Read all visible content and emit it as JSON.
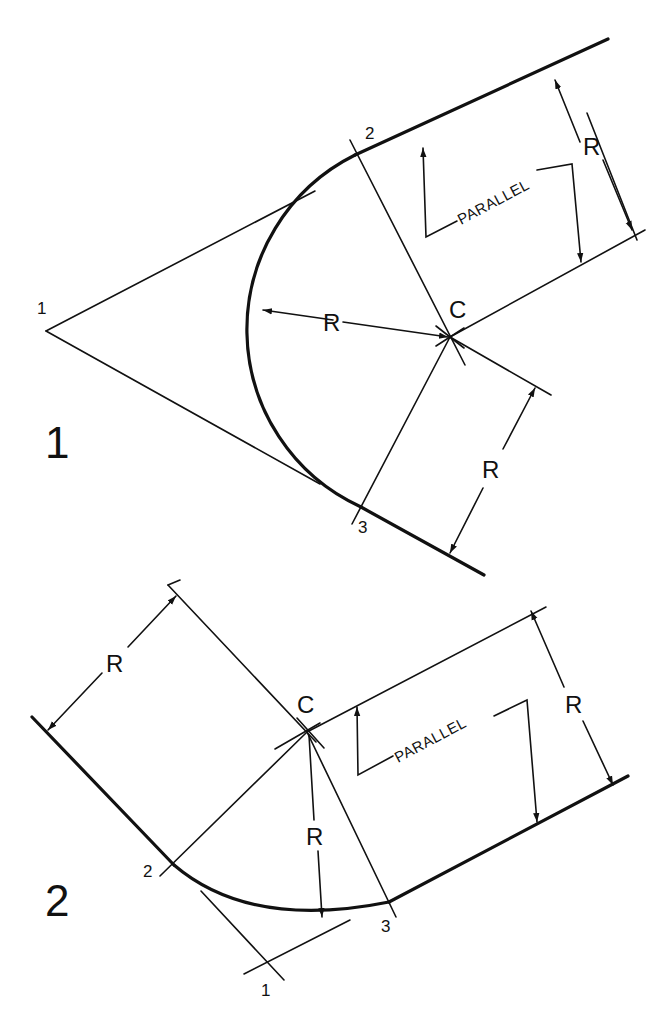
{
  "figures": [
    {
      "number_label": "1",
      "center_label": "C",
      "point_labels": [
        "1",
        "2",
        "3"
      ],
      "radius_labels": [
        "R",
        "R",
        "R"
      ],
      "parallel_label": "PARALLEL"
    },
    {
      "number_label": "2",
      "center_label": "C",
      "point_labels": [
        "1",
        "2",
        "3"
      ],
      "radius_labels": [
        "R",
        "R",
        "R"
      ],
      "parallel_label": "PARALLEL"
    }
  ],
  "colors": {
    "ink": "#111111",
    "background": "#ffffff"
  }
}
